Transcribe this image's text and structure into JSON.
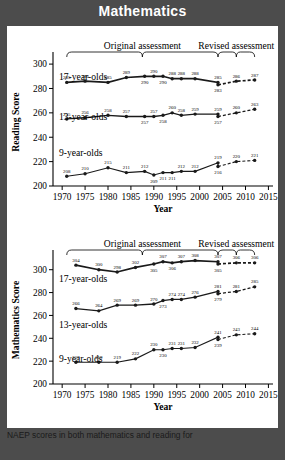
{
  "banner": {
    "title": "Mathematics"
  },
  "caption": {
    "text": "NAEP scores in both mathematics and reading for"
  },
  "chart_data": [
    {
      "type": "line",
      "id": "reading",
      "title": "",
      "xlabel": "Year",
      "ylabel": "Reading Score",
      "xlim": [
        1968,
        2016
      ],
      "ylim": [
        200,
        305
      ],
      "yticks": [
        200,
        220,
        240,
        260,
        280,
        300
      ],
      "xticks": [
        1970,
        1975,
        1980,
        1985,
        1990,
        1995,
        2000,
        2005,
        2010,
        2015
      ],
      "grid": false,
      "legend": "inline-labels",
      "annotations": [
        {
          "text": "Original assessment",
          "span": [
            1971,
            2004
          ]
        },
        {
          "text": "Revised assessment",
          "span": [
            2004,
            2012
          ]
        }
      ],
      "series": [
        {
          "name": "17-year-olds",
          "x": [
            1971,
            1975,
            1980,
            1984,
            1988,
            1990,
            1992,
            1994,
            1996,
            1999,
            2004,
            2004,
            2008,
            2012
          ],
          "values": [
            285,
            286,
            285,
            289,
            290,
            290,
            290,
            288,
            288,
            288,
            285,
            283,
            286,
            287
          ],
          "dashed_from_index": 11
        },
        {
          "name": "13-year-olds",
          "x": [
            1971,
            1975,
            1980,
            1984,
            1988,
            1990,
            1992,
            1994,
            1996,
            1999,
            2004,
            2004,
            2008,
            2012
          ],
          "values": [
            255,
            256,
            258,
            257,
            257,
            257,
            258,
            260,
            258,
            259,
            259,
            257,
            260,
            263
          ],
          "dashed_from_index": 11
        },
        {
          "name": "9-year-olds",
          "x": [
            1971,
            1975,
            1980,
            1984,
            1988,
            1990,
            1992,
            1994,
            1996,
            1999,
            2004,
            2004,
            2008,
            2012
          ],
          "values": [
            208,
            210,
            215,
            211,
            212,
            209,
            211,
            211,
            212,
            212,
            219,
            216,
            220,
            221
          ],
          "dashed_from_index": 11
        }
      ]
    },
    {
      "type": "line",
      "id": "mathematics",
      "title": "",
      "xlabel": "Year",
      "ylabel": "Mathematics Score",
      "xlim": [
        1968,
        2016
      ],
      "ylim": [
        200,
        312
      ],
      "yticks": [
        200,
        220,
        240,
        260,
        280,
        300
      ],
      "xticks": [
        1970,
        1975,
        1980,
        1985,
        1990,
        1995,
        2000,
        2005,
        2010,
        2015
      ],
      "grid": false,
      "legend": "inline-labels",
      "annotations": [
        {
          "text": "Original assessment",
          "span": [
            1971,
            2004
          ]
        },
        {
          "text": "Revised assessment",
          "span": [
            2004,
            2012
          ]
        }
      ],
      "series": [
        {
          "name": "17-year-olds",
          "x": [
            1973,
            1978,
            1982,
            1986,
            1990,
            1992,
            1994,
            1996,
            1999,
            2004,
            2004,
            2008,
            2012
          ],
          "values": [
            304,
            300,
            298,
            302,
            305,
            307,
            306,
            307,
            308,
            307,
            305,
            306,
            306
          ],
          "dashed_from_index": 10
        },
        {
          "name": "13-year-olds",
          "x": [
            1973,
            1978,
            1982,
            1986,
            1990,
            1992,
            1994,
            1996,
            1999,
            2004,
            2004,
            2008,
            2012
          ],
          "values": [
            266,
            264,
            269,
            269,
            270,
            273,
            274,
            274,
            276,
            281,
            279,
            281,
            285
          ],
          "dashed_from_index": 10
        },
        {
          "name": "9-year-olds",
          "x": [
            1973,
            1978,
            1982,
            1986,
            1990,
            1992,
            1994,
            1996,
            1999,
            2004,
            2004,
            2008,
            2012
          ],
          "values": [
            219,
            219,
            219,
            222,
            230,
            230,
            231,
            231,
            232,
            241,
            239,
            243,
            244
          ],
          "dashed_from_index": 10
        }
      ]
    }
  ]
}
